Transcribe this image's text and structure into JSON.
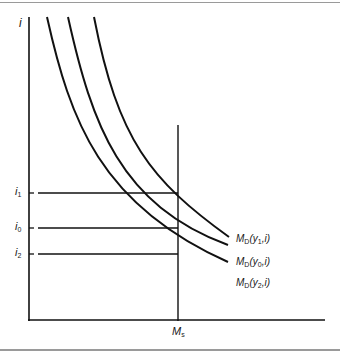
{
  "diagram": {
    "y_axis_label": "i",
    "x_axis_marker_label": "M",
    "x_axis_marker_sub": "s",
    "rate_labels": [
      {
        "main": "i",
        "sub": "1"
      },
      {
        "main": "i",
        "sub": "0"
      },
      {
        "main": "i",
        "sub": "2"
      }
    ],
    "curve_labels": [
      {
        "pre": "M",
        "sub1": "D",
        "mid": "(y",
        "sub2": "1",
        "post": ",i)"
      },
      {
        "pre": "M",
        "sub1": "D",
        "mid": "(y",
        "sub2": "0",
        "post": ",i)"
      },
      {
        "pre": "M",
        "sub1": "D",
        "mid": "(y",
        "sub2": "2",
        "post": ",i)"
      }
    ],
    "line_color": "#111111",
    "frame_color": "#9a9a9a"
  }
}
